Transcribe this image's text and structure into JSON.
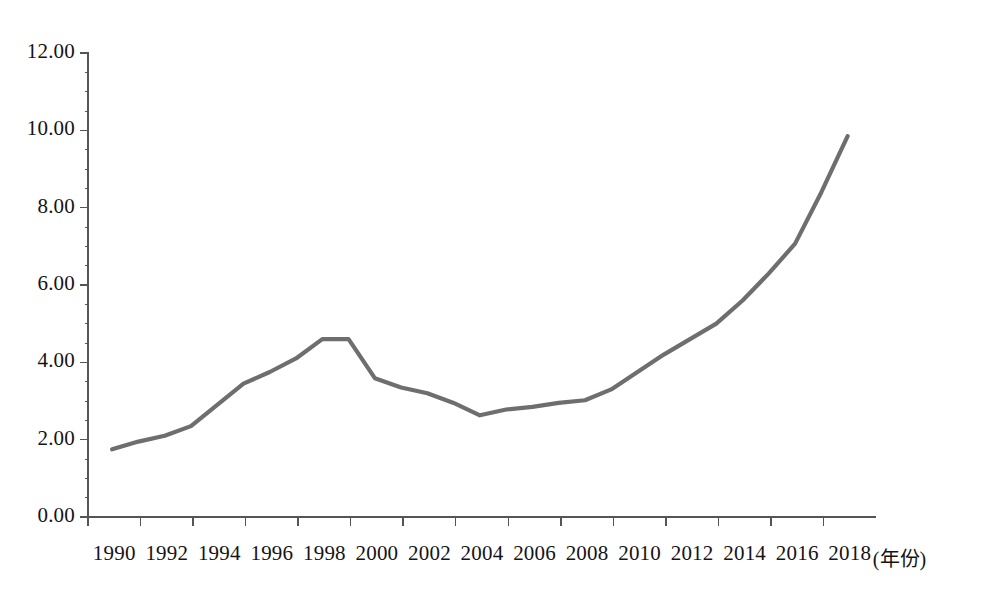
{
  "chart_data": {
    "type": "line",
    "title": "",
    "subtitle": "",
    "xlabel": "(年份)",
    "ylabel": "",
    "xlim": [
      1990,
      2018
    ],
    "ylim": [
      0.0,
      12.0
    ],
    "grid": false,
    "legend": false,
    "legend_position": "none",
    "line_color": "#6e6e6e",
    "axis_color": "#555555",
    "x_tick_labels": [
      "1990",
      "1992",
      "1994",
      "1996",
      "1998",
      "2000",
      "2002",
      "2004",
      "2006",
      "2008",
      "2010",
      "2012",
      "2014",
      "2016",
      "2018"
    ],
    "y_tick_labels": [
      "0.00",
      "2.00",
      "4.00",
      "6.00",
      "8.00",
      "10.00",
      "12.00"
    ],
    "y_ticks": [
      0.0,
      2.0,
      4.0,
      6.0,
      8.0,
      10.0,
      12.0
    ],
    "x": [
      1990,
      1991,
      1992,
      1993,
      1994,
      1995,
      1996,
      1997,
      1998,
      1999,
      2000,
      2001,
      2002,
      2003,
      2004,
      2005,
      2006,
      2007,
      2008,
      2009,
      2010,
      2011,
      2012,
      2013,
      2014,
      2015,
      2016,
      2017,
      2018
    ],
    "values": [
      1.75,
      1.95,
      2.1,
      2.35,
      2.9,
      3.45,
      3.75,
      4.1,
      4.6,
      4.6,
      3.59,
      3.35,
      3.2,
      2.95,
      2.63,
      2.78,
      2.85,
      2.95,
      3.02,
      3.3,
      3.75,
      4.2,
      4.6,
      5.0,
      5.6,
      6.3,
      7.07,
      8.4,
      9.85
    ],
    "series": [
      {
        "name": "series-1",
        "values": [
          1.75,
          1.95,
          2.1,
          2.35,
          2.9,
          3.45,
          3.75,
          4.1,
          4.6,
          4.6,
          3.59,
          3.35,
          3.2,
          2.95,
          2.63,
          2.78,
          2.85,
          2.95,
          3.02,
          3.3,
          3.75,
          4.2,
          4.6,
          5.0,
          5.6,
          6.3,
          7.07,
          8.4,
          9.85
        ]
      }
    ],
    "annotations": []
  }
}
